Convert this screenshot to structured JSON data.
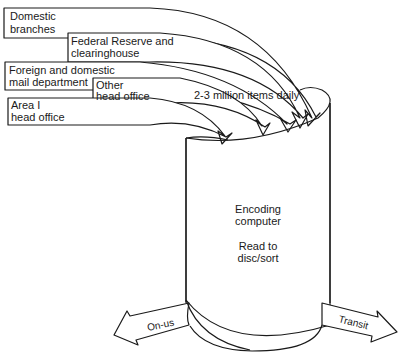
{
  "diagram": {
    "sources": [
      {
        "id": "domestic-branches",
        "lines": [
          "Domestic",
          "branches"
        ]
      },
      {
        "id": "federal-reserve",
        "lines": [
          "Federal Reserve and",
          "clearinghouse"
        ]
      },
      {
        "id": "foreign-domestic-mail",
        "lines": [
          "Foreign and domestic",
          "mail department"
        ]
      },
      {
        "id": "other-head-office",
        "lines": [
          "Other",
          "head office"
        ]
      },
      {
        "id": "area-head-office",
        "lines": [
          "Area I",
          "head office"
        ]
      }
    ],
    "volume_label": "2-3 million items daily",
    "processor": {
      "lines": [
        "Encoding",
        "computer",
        "",
        "Read to",
        "disc/sort"
      ],
      "title_lines": [
        "Encoding",
        "computer"
      ],
      "subtitle_lines": [
        "Read to",
        "disc/sort"
      ]
    },
    "outputs": [
      {
        "id": "on-us",
        "label": "On-us"
      },
      {
        "id": "transit",
        "label": "Transit"
      }
    ]
  }
}
